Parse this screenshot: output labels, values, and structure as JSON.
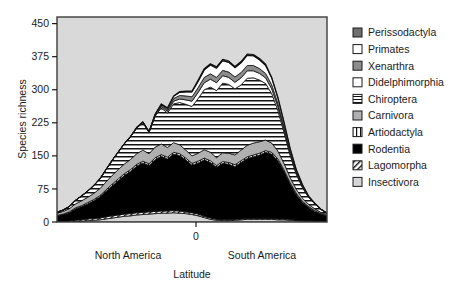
{
  "chart_data": {
    "type": "area",
    "stacked": true,
    "title": "",
    "xlabel": "Latitude",
    "ylabel": "Species richness",
    "ylim": [
      0,
      465
    ],
    "yticks": [
      0,
      75,
      150,
      225,
      300,
      375,
      450
    ],
    "ytick_labels": [
      "0",
      "75",
      "150",
      "225",
      "300",
      "375",
      "450"
    ],
    "xticks": [
      0
    ],
    "xtick_labels": [
      "0"
    ],
    "grid": false,
    "legend_position": "right",
    "plot_background": "#d9d9d9",
    "annotations": [
      {
        "text": "North America",
        "x_frac": 0.26,
        "y": "below-axis"
      },
      {
        "text": "South America",
        "x_frac": 0.72,
        "y": "below-axis"
      }
    ],
    "x": [
      0,
      1,
      2,
      3,
      4,
      5,
      6,
      7,
      8,
      9,
      10,
      11,
      12,
      13,
      14,
      15,
      16,
      17,
      18,
      19,
      20,
      21,
      22,
      23,
      24,
      25,
      26,
      27,
      28,
      29,
      30,
      31,
      32,
      33,
      34,
      35,
      36,
      37,
      38,
      39,
      40,
      41,
      42,
      43,
      44
    ],
    "series": [
      {
        "name": "Insectivora",
        "swatch": "light-gray",
        "values": [
          0,
          0,
          0,
          1,
          2,
          3,
          4,
          5,
          7,
          9,
          11,
          13,
          14,
          16,
          17,
          18,
          19,
          20,
          20,
          21,
          20,
          19,
          17,
          14,
          10,
          6,
          4,
          3,
          3,
          4,
          5,
          6,
          6,
          6,
          6,
          6,
          5,
          5,
          4,
          3,
          2,
          2,
          1,
          1,
          0
        ]
      },
      {
        "name": "Lagomorpha",
        "swatch": "diagonal-hatch",
        "values": [
          1,
          1,
          2,
          3,
          3,
          4,
          4,
          4,
          5,
          5,
          5,
          5,
          5,
          5,
          5,
          5,
          5,
          5,
          5,
          5,
          5,
          4,
          4,
          4,
          3,
          3,
          2,
          2,
          2,
          2,
          2,
          2,
          2,
          2,
          2,
          2,
          2,
          2,
          2,
          1,
          1,
          1,
          1,
          1,
          1
        ]
      },
      {
        "name": "Rodentia",
        "swatch": "black",
        "values": [
          13,
          16,
          19,
          26,
          30,
          34,
          40,
          48,
          58,
          68,
          78,
          88,
          96,
          106,
          112,
          105,
          118,
          124,
          118,
          128,
          126,
          118,
          108,
          116,
          128,
          126,
          118,
          128,
          126,
          120,
          128,
          136,
          140,
          144,
          150,
          146,
          132,
          108,
          80,
          58,
          42,
          30,
          22,
          16,
          12
        ]
      },
      {
        "name": "Artiodactyla",
        "swatch": "vertical-lines",
        "values": [
          1,
          1,
          2,
          2,
          2,
          3,
          3,
          3,
          3,
          4,
          4,
          4,
          4,
          4,
          4,
          4,
          4,
          4,
          4,
          4,
          4,
          4,
          4,
          4,
          4,
          4,
          4,
          4,
          4,
          4,
          4,
          4,
          4,
          4,
          4,
          4,
          4,
          3,
          3,
          3,
          2,
          2,
          2,
          1,
          1
        ]
      },
      {
        "name": "Carnivora",
        "swatch": "gray",
        "values": [
          5,
          6,
          7,
          9,
          11,
          12,
          14,
          16,
          18,
          20,
          21,
          22,
          23,
          24,
          25,
          23,
          24,
          24,
          22,
          22,
          20,
          18,
          17,
          18,
          19,
          19,
          18,
          20,
          21,
          22,
          24,
          26,
          27,
          26,
          24,
          21,
          18,
          15,
          12,
          9,
          7,
          5,
          4,
          3,
          2
        ]
      },
      {
        "name": "Chiroptera",
        "swatch": "horizontal-lines",
        "values": [
          2,
          3,
          5,
          8,
          11,
          14,
          18,
          22,
          28,
          34,
          40,
          46,
          52,
          58,
          62,
          48,
          70,
          82,
          78,
          88,
          96,
          104,
          112,
          124,
          136,
          148,
          152,
          158,
          156,
          150,
          148,
          152,
          148,
          140,
          128,
          112,
          92,
          70,
          50,
          34,
          24,
          16,
          11,
          7,
          4
        ]
      },
      {
        "name": "Didelphimorphia",
        "swatch": "white",
        "values": [
          0,
          0,
          0,
          0,
          0,
          0,
          0,
          0,
          0,
          0,
          0,
          0,
          0,
          1,
          1,
          1,
          2,
          3,
          4,
          6,
          8,
          10,
          12,
          14,
          16,
          18,
          18,
          17,
          16,
          15,
          16,
          17,
          16,
          15,
          13,
          11,
          9,
          7,
          5,
          3,
          2,
          1,
          1,
          0,
          0
        ]
      },
      {
        "name": "Xenarthra",
        "swatch": "mid-gray",
        "values": [
          0,
          0,
          0,
          0,
          0,
          0,
          0,
          0,
          0,
          0,
          0,
          0,
          0,
          1,
          1,
          1,
          2,
          3,
          4,
          6,
          8,
          9,
          10,
          11,
          12,
          12,
          12,
          12,
          12,
          12,
          12,
          12,
          12,
          11,
          10,
          9,
          7,
          6,
          4,
          3,
          2,
          1,
          1,
          0,
          0
        ]
      },
      {
        "name": "Primates",
        "swatch": "white",
        "values": [
          0,
          0,
          0,
          0,
          0,
          0,
          0,
          0,
          0,
          0,
          0,
          0,
          0,
          0,
          0,
          0,
          1,
          2,
          3,
          5,
          7,
          9,
          11,
          14,
          17,
          20,
          21,
          22,
          22,
          21,
          22,
          23,
          22,
          20,
          18,
          15,
          12,
          9,
          6,
          4,
          2,
          1,
          0,
          0,
          0
        ]
      },
      {
        "name": "Perissodactyla",
        "swatch": "dark-gray",
        "values": [
          0,
          0,
          0,
          0,
          0,
          0,
          0,
          0,
          0,
          0,
          0,
          0,
          0,
          0,
          0,
          0,
          0,
          1,
          1,
          1,
          2,
          2,
          2,
          3,
          3,
          3,
          3,
          3,
          3,
          3,
          3,
          3,
          3,
          3,
          3,
          2,
          2,
          2,
          1,
          1,
          1,
          0,
          0,
          0,
          0
        ]
      }
    ]
  },
  "legend": {
    "items": [
      {
        "label": "Perissodactyla",
        "swatch": "dark-gray"
      },
      {
        "label": "Primates",
        "swatch": "white"
      },
      {
        "label": "Xenarthra",
        "swatch": "mid-gray"
      },
      {
        "label": "Didelphimorphia",
        "swatch": "white"
      },
      {
        "label": "Chiroptera",
        "swatch": "horizontal-lines"
      },
      {
        "label": "Carnivora",
        "swatch": "gray"
      },
      {
        "label": "Artiodactyla",
        "swatch": "vertical-lines"
      },
      {
        "label": "Rodentia",
        "swatch": "black"
      },
      {
        "label": "Lagomorpha",
        "swatch": "diagonal-hatch"
      },
      {
        "label": "Insectivora",
        "swatch": "light-gray"
      }
    ]
  },
  "axes": {
    "y_title": "Species richness",
    "x_title": "Latitude",
    "x_zero_label": "0",
    "region_left": "North America",
    "region_right": "South America",
    "ytick_labels": [
      "450",
      "375",
      "300",
      "225",
      "150",
      "75",
      "0"
    ]
  },
  "colors": {
    "plot_bg": "#d9d9d9",
    "frame": "#3c3c3c",
    "black": "#000000",
    "dark_gray": "#6e6e6e",
    "mid_gray": "#8c8c8c",
    "gray": "#b0b0b0",
    "light_gray": "#d5d5d5",
    "white": "#ffffff",
    "text": "#1a1a1a"
  }
}
